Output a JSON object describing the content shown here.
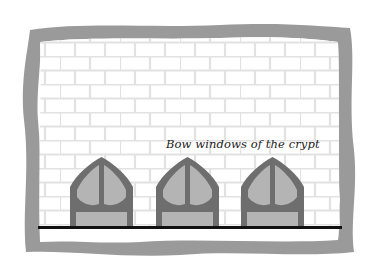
{
  "illustration": {
    "caption": "Bow windows of the crypt",
    "window_count": 3,
    "colors": {
      "frame": "#9a9a9a",
      "brick_mortar": "#e4e4e4",
      "wall": "#ffffff",
      "window_frame": "#6e6e6e",
      "window_glass": "#b4b4b4",
      "ground_line": "#111111"
    }
  }
}
